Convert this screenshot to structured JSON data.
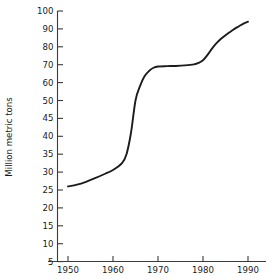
{
  "chart_data": {
    "type": "line",
    "title": "",
    "subtitle": "",
    "xlabel": "",
    "ylabel": "Million metric tons",
    "grid": false,
    "legend": "none",
    "xlim": [
      1948,
      1992
    ],
    "ylim": [
      0,
      100
    ],
    "y_scale_note": "Broken/expanded scale: ticks every 5 units from 5 to 50, every 10 units from 50 to 100; pixel spacing uniform",
    "x_ticks": [
      1950,
      1960,
      1970,
      1980,
      1990
    ],
    "x_tick_labels": [
      "1950",
      "1960",
      "1970",
      "1980",
      "1990"
    ],
    "y_ticks": [
      5,
      10,
      15,
      20,
      25,
      30,
      35,
      40,
      45,
      50,
      60,
      70,
      80,
      90,
      100
    ],
    "y_tick_labels": [
      "5",
      "10",
      "15",
      "20",
      "25",
      "30",
      "35",
      "40",
      "45",
      "50",
      "60",
      "70",
      "80",
      "90",
      "100"
    ],
    "series": [
      {
        "name": "Production",
        "color": "#1c1c1c",
        "x": [
          1950,
          1952,
          1954,
          1956,
          1958,
          1960,
          1962,
          1963,
          1964,
          1965,
          1966,
          1967,
          1968,
          1969,
          1970,
          1972,
          1974,
          1976,
          1978,
          1979,
          1980,
          1981,
          1982,
          1983,
          1984,
          1985,
          1986,
          1987,
          1988,
          1989,
          1990
        ],
        "values": [
          26,
          26.5,
          27.3,
          28.3,
          29.4,
          30.6,
          32.5,
          35,
          41,
          50,
          58,
          63.5,
          66.5,
          68.3,
          69,
          69.2,
          69.3,
          69.6,
          70.2,
          71,
          72.5,
          75.5,
          79,
          82,
          84.5,
          86.5,
          88.3,
          90,
          91.5,
          93,
          94
        ]
      }
    ],
    "annotations": []
  },
  "axis": {
    "y_title": "Million metric tons"
  }
}
